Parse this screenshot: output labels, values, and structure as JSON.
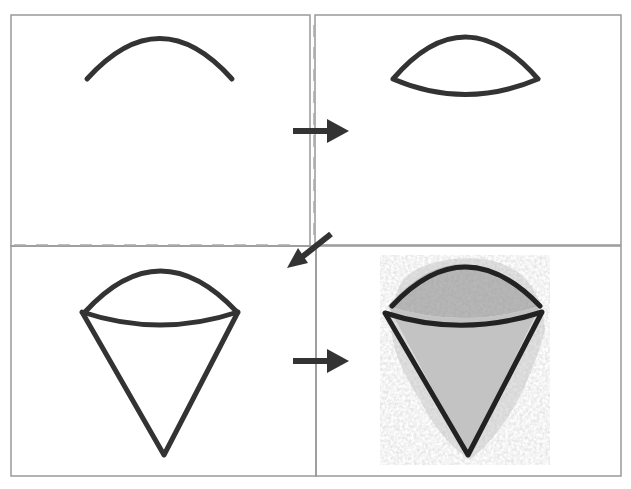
{
  "diagram": {
    "type": "step-by-step drawing tutorial",
    "colors": {
      "stroke": "#333333",
      "frame": "#999999",
      "guide": "#aaaaaa",
      "shading": "#b8b8b8",
      "shading_dark": "#8c8c8c"
    },
    "steps": [
      {
        "index": 1,
        "description": "Draw an arc (top curve)"
      },
      {
        "index": 2,
        "description": "Close the arc with a lower curve to form a dome shape"
      },
      {
        "index": 3,
        "description": "Add a cone below the dome"
      },
      {
        "index": 4,
        "description": "Shade the dome and cone with gray"
      }
    ],
    "arrows": [
      {
        "from": 1,
        "to": 2,
        "direction": "right"
      },
      {
        "from": 2,
        "to": 3,
        "direction": "down-left"
      },
      {
        "from": 3,
        "to": 4,
        "direction": "right"
      }
    ]
  }
}
